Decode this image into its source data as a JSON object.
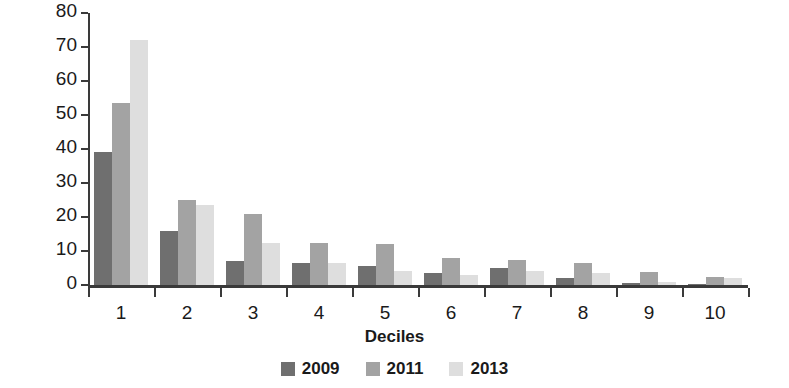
{
  "chart_data": {
    "type": "bar",
    "title": "",
    "subtitle": "",
    "xlabel": "Deciles",
    "ylabel": "Coverage (%)",
    "categories": [
      "1",
      "2",
      "3",
      "4",
      "5",
      "6",
      "7",
      "8",
      "9",
      "10"
    ],
    "series": [
      {
        "name": "2009",
        "color": "#6f6f6f",
        "values": [
          39,
          16,
          7,
          6.5,
          5.5,
          3.5,
          5,
          2,
          0.7,
          0.3
        ]
      },
      {
        "name": "2011",
        "color": "#a3a3a3",
        "values": [
          53.5,
          25,
          21,
          12.5,
          12,
          8,
          7.5,
          6.5,
          3.8,
          2.5
        ]
      },
      {
        "name": "2013",
        "color": "#dedede",
        "values": [
          72,
          23.5,
          12.5,
          6.5,
          4.2,
          3,
          4,
          3.5,
          0.8,
          2
        ]
      }
    ],
    "ylim": [
      0,
      80
    ],
    "yticks": [
      0,
      10,
      20,
      30,
      40,
      50,
      60,
      70,
      80
    ],
    "ytick_labels": [
      "0",
      "10",
      "20",
      "30",
      "40",
      "50",
      "60",
      "70",
      "80"
    ],
    "grid": false,
    "legend_position": "bottom",
    "axis_color": "#3a3a3a",
    "background_color": "#ffffff"
  },
  "legend": {
    "items": [
      {
        "label": "2009",
        "color": "#6f6f6f"
      },
      {
        "label": "2011",
        "color": "#a3a3a3"
      },
      {
        "label": "2013",
        "color": "#dedede"
      }
    ]
  }
}
